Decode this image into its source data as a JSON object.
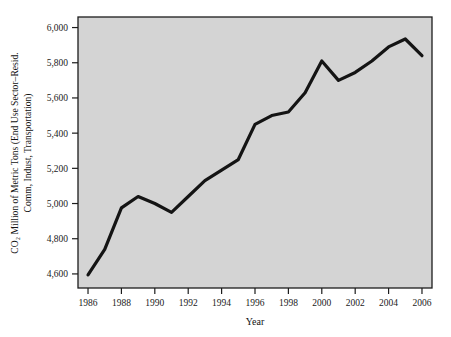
{
  "chart_data": {
    "type": "line",
    "title": "",
    "xlabel": "Year",
    "ylabel_line1": "CO₂ Million of Metric Tons (End Use Sector–Resid.",
    "ylabel_line2": "Comm, Indust, Transportation)",
    "xlim": [
      1985.4,
      2006.6
    ],
    "ylim": [
      4520,
      6060
    ],
    "grid": false,
    "legend": "none",
    "xticks": [
      1986,
      1988,
      1990,
      1992,
      1994,
      1996,
      1998,
      2000,
      2002,
      2004,
      2006
    ],
    "xtick_labels": [
      "1986",
      "1988",
      "1990",
      "1992",
      "1994",
      "1996",
      "1998",
      "2000",
      "2002",
      "2004",
      "2006"
    ],
    "yticks": [
      4600,
      4800,
      5000,
      5200,
      5400,
      5600,
      5800,
      6000
    ],
    "ytick_labels": [
      "4,600",
      "4,800",
      "5,000",
      "5,200",
      "5,400",
      "5,600",
      "5,800",
      "6,000"
    ],
    "x": [
      1986,
      1987,
      1988,
      1989,
      1990,
      1991,
      1992,
      1993,
      1994,
      1995,
      1996,
      1997,
      1998,
      1999,
      2000,
      2001,
      2002,
      2003,
      2004,
      2005,
      2006
    ],
    "values": [
      4595,
      4740,
      4975,
      5040,
      5000,
      4950,
      5040,
      5130,
      5190,
      5250,
      5450,
      5500,
      5520,
      5630,
      5810,
      5700,
      5745,
      5810,
      5890,
      5935,
      5840
    ],
    "series": [
      {
        "name": "CO2 emissions",
        "values": [
          4595,
          4740,
          4975,
          5040,
          5000,
          4950,
          5040,
          5130,
          5190,
          5250,
          5450,
          5500,
          5520,
          5630,
          5810,
          5700,
          5745,
          5810,
          5890,
          5935,
          5840
        ]
      }
    ],
    "colors": {
      "line": "#141414",
      "plot_background": "#d4d4d4",
      "frame": "#1c1c1c",
      "page_background": "#ffffff",
      "text": "#111111"
    },
    "line_width": 3.2
  }
}
